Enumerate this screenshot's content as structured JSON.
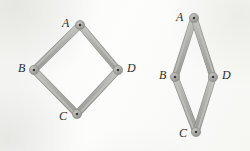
{
  "figure": {
    "background_color": "#fbfbfa",
    "rod_color": "#a9a9a6",
    "rod_edge_color": "#8e8e8b",
    "rod_highlight_color": "#c4c4c0",
    "joint_color": "#a2a29f",
    "joint_center_color": "#3a3a3a",
    "label_color": "#2b2b2b",
    "rod_width": 6,
    "joint_radius": 4.6,
    "joint_center_radius": 1.3
  },
  "diagrams": [
    {
      "name": "square-linkage",
      "caption": "left",
      "vertices": [
        {
          "id": "A",
          "label": "A",
          "x": 80,
          "y": 25,
          "label_x": 62,
          "label_y": 17
        },
        {
          "id": "B",
          "label": "B",
          "x": 34,
          "y": 70,
          "label_x": 18,
          "label_y": 62
        },
        {
          "id": "C",
          "label": "C",
          "x": 77,
          "y": 114,
          "label_x": 59,
          "label_y": 110
        },
        {
          "id": "D",
          "label": "D",
          "x": 118,
          "y": 70,
          "label_x": 127,
          "label_y": 62
        }
      ],
      "edges": [
        {
          "from": "A",
          "to": "B"
        },
        {
          "from": "B",
          "to": "C"
        },
        {
          "from": "C",
          "to": "D"
        },
        {
          "from": "D",
          "to": "A"
        }
      ]
    },
    {
      "name": "rhombus-linkage",
      "caption": "right",
      "vertices": [
        {
          "id": "A",
          "label": "A",
          "x": 194,
          "y": 18,
          "label_x": 176,
          "label_y": 11
        },
        {
          "id": "B",
          "label": "B",
          "x": 175,
          "y": 77,
          "label_x": 159,
          "label_y": 69
        },
        {
          "id": "C",
          "label": "C",
          "x": 196,
          "y": 132,
          "label_x": 179,
          "label_y": 127
        },
        {
          "id": "D",
          "label": "D",
          "x": 213,
          "y": 77,
          "label_x": 222,
          "label_y": 69
        }
      ],
      "edges": [
        {
          "from": "A",
          "to": "B"
        },
        {
          "from": "B",
          "to": "C"
        },
        {
          "from": "C",
          "to": "D"
        },
        {
          "from": "D",
          "to": "A"
        }
      ]
    }
  ]
}
